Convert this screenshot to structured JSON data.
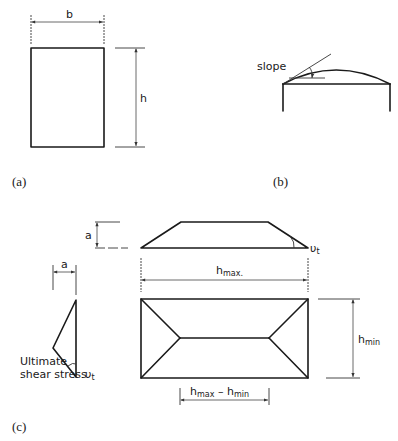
{
  "panels": {
    "a": {
      "caption": "(a)",
      "width_label": "b",
      "height_label": "h"
    },
    "b": {
      "caption": "(b)",
      "slope_label": "slope"
    },
    "c": {
      "caption": "(c)",
      "rise_label_top": "a",
      "rise_label_left": "a",
      "angle_symbol": "υ",
      "angle_subscript": "t",
      "angle_symbol_left": "υ",
      "angle_subscript_left": "t",
      "hmax_main": "h",
      "hmax_sub": "max.",
      "hmin_main": "h",
      "hmin_sub": "min",
      "diff_main1": "h",
      "diff_sub1": "max",
      "diff_minus": " – ",
      "diff_main2": "h",
      "diff_sub2": "min",
      "shear_line1": "Ultimate",
      "shear_line2": "shear stress"
    }
  },
  "colors": {
    "line": "#1a1a1a",
    "background": "#ffffff"
  }
}
